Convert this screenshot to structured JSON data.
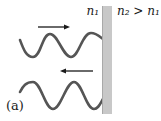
{
  "diagram": {
    "medium_left_label": "n₁",
    "medium_right_label": "n₂ > n₁",
    "figure_label": "(a)",
    "waves": [
      {
        "name": "incident-wave",
        "direction": "right",
        "cycles": 2
      },
      {
        "name": "reflected-wave",
        "direction": "left",
        "cycles": 2
      }
    ],
    "colors": {
      "wave": "#555555",
      "arrow": "#1a1a1a",
      "boundary_fill": "#c8c8c8",
      "boundary_edge": "#a9a9a9",
      "background": "#ffffff"
    }
  }
}
